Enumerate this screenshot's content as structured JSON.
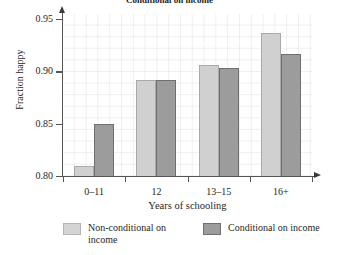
{
  "chart_data": {
    "type": "bar",
    "title": "Conditional on income",
    "xlabel": "Years of schooling",
    "ylabel": "Fraction happy",
    "categories": [
      "0–11",
      "12",
      "13–15",
      "16+"
    ],
    "series": [
      {
        "name": "Non-conditional on income",
        "color": "#d0d0d0",
        "values": [
          0.81,
          0.892,
          0.906,
          0.937
        ]
      },
      {
        "name": "Conditional on income",
        "color": "#9c9c9c",
        "values": [
          0.85,
          0.892,
          0.903,
          0.917
        ]
      }
    ],
    "ylim": [
      0.8,
      0.955
    ],
    "yticks": [
      0.8,
      0.85,
      0.9,
      0.95
    ],
    "ytick_labels": [
      "0.80",
      "0.85",
      "0.90",
      "0.95"
    ],
    "grid": true,
    "legend_position": "bottom"
  }
}
